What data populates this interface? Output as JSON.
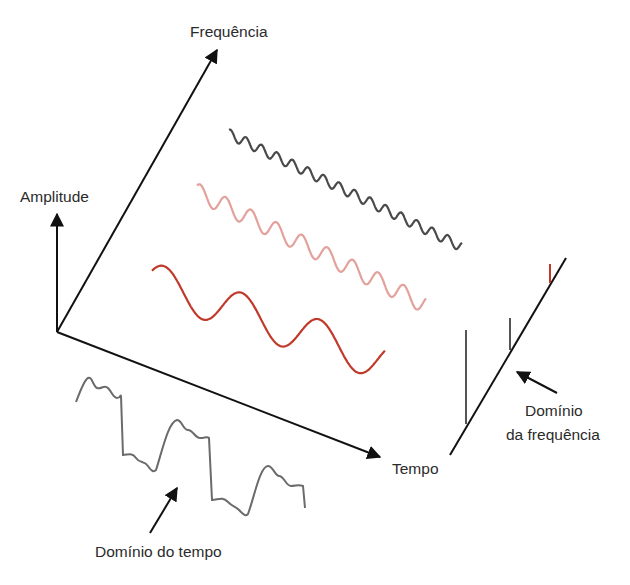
{
  "diagram": {
    "type": "time-frequency-domain illustration",
    "axes": {
      "amplitude": {
        "label": "Amplitude"
      },
      "frequency": {
        "label": "Frequência"
      },
      "time": {
        "label": "Tempo"
      }
    },
    "components": [
      {
        "name": "low-frequency",
        "color": "#c0392b",
        "cycles": 3
      },
      {
        "name": "mid-frequency",
        "color": "#e3a19b",
        "cycles": 9
      },
      {
        "name": "high-frequency",
        "color": "#4a4a4a",
        "cycles": 15
      }
    ],
    "annotations": {
      "time_domain": "Domínio do tempo",
      "frequency_domain_line1": "Domínio",
      "frequency_domain_line2": "da frequência"
    },
    "colors": {
      "axis": "#111111",
      "composite_wave": "#6b6b6b",
      "spectrum_bar_gray": "#555555",
      "spectrum_bar_red": "#c0392b"
    }
  }
}
